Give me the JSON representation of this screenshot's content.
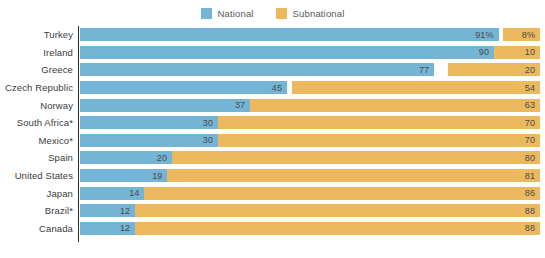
{
  "legend": {
    "position": "top-center",
    "entries": [
      {
        "label": "National",
        "color": "#74b4d4",
        "name": "legend-national"
      },
      {
        "label": "Subnational",
        "color": "#edb95e",
        "name": "legend-subnational"
      }
    ]
  },
  "colors": {
    "national": "#74b4d4",
    "subnational": "#edb95e",
    "axis": "#2b2b2b",
    "label_text": "#3b3b3d",
    "value_text": "#4a4a4c",
    "background": "#ffffff"
  },
  "chart_data": {
    "type": "bar",
    "orientation": "horizontal",
    "stacked": true,
    "title": "",
    "subtitle": "",
    "xlabel": "",
    "ylabel": "",
    "xlim": [
      0,
      100
    ],
    "grid": false,
    "legend_position": "top-center",
    "categories": [
      "Turkey",
      "Ireland",
      "Greece",
      "Czech Republic",
      "Norway",
      "South Africa*",
      "Mexico*",
      "Spain",
      "United States",
      "Japan",
      "Brazil*",
      "Canada"
    ],
    "series": [
      {
        "name": "National",
        "color": "#74b4d4",
        "values": [
          91,
          90,
          77,
          45,
          37,
          30,
          30,
          20,
          19,
          14,
          12,
          12
        ],
        "labels": [
          "91%",
          "90",
          "77",
          "45",
          "37",
          "30",
          "30",
          "20",
          "19",
          "14",
          "12",
          "12"
        ]
      },
      {
        "name": "Subnational",
        "color": "#edb95e",
        "values": [
          8,
          10,
          20,
          54,
          63,
          70,
          70,
          80,
          81,
          86,
          88,
          88
        ],
        "labels": [
          "8%",
          "10",
          "20",
          "54",
          "63",
          "70",
          "70",
          "80",
          "81",
          "86",
          "88",
          "88"
        ]
      }
    ],
    "rows": [
      {
        "category": "Turkey",
        "national": 91,
        "national_label": "91%",
        "subnational": 8,
        "subnational_label": "8%"
      },
      {
        "category": "Ireland",
        "national": 90,
        "national_label": "90",
        "subnational": 10,
        "subnational_label": "10"
      },
      {
        "category": "Greece",
        "national": 77,
        "national_label": "77",
        "subnational": 20,
        "subnational_label": "20"
      },
      {
        "category": "Czech Republic",
        "national": 45,
        "national_label": "45",
        "subnational": 54,
        "subnational_label": "54"
      },
      {
        "category": "Norway",
        "national": 37,
        "national_label": "37",
        "subnational": 63,
        "subnational_label": "63"
      },
      {
        "category": "South Africa*",
        "national": 30,
        "national_label": "30",
        "subnational": 70,
        "subnational_label": "70"
      },
      {
        "category": "Mexico*",
        "national": 30,
        "national_label": "30",
        "subnational": 70,
        "subnational_label": "70"
      },
      {
        "category": "Spain",
        "national": 20,
        "national_label": "20",
        "subnational": 80,
        "subnational_label": "80"
      },
      {
        "category": "United States",
        "national": 19,
        "national_label": "19",
        "subnational": 81,
        "subnational_label": "81"
      },
      {
        "category": "Japan",
        "national": 14,
        "national_label": "14",
        "subnational": 86,
        "subnational_label": "86"
      },
      {
        "category": "Brazil*",
        "national": 12,
        "national_label": "12",
        "subnational": 88,
        "subnational_label": "88"
      },
      {
        "category": "Canada",
        "national": 12,
        "national_label": "12",
        "subnational": 88,
        "subnational_label": "88"
      }
    ]
  }
}
